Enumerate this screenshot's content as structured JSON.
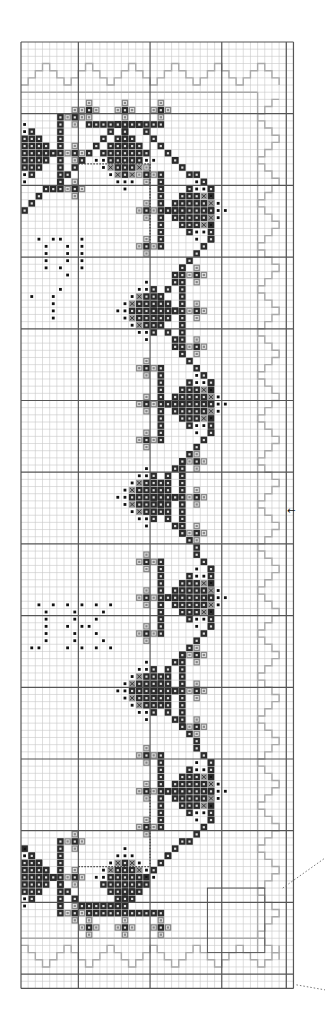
{
  "chart": {
    "type": "cross-stitch-pattern",
    "origin": [
      21,
      42
    ],
    "cell": 7.17,
    "cols": 38,
    "rows": 132,
    "major_every": 10,
    "major_offset_col": 8,
    "major_offset_row": 0
  },
  "colors": {
    "minor_line": "#c8c8c8",
    "major_line": "#555555",
    "dark_fill": "#2b2b2b",
    "mid_fill": "#8a8a8a",
    "dot": "#111111",
    "border_outline": "#a9a9a9",
    "leader_line": "#777777"
  },
  "legend_symbols": {
    "dark": "filled-triangle-stitch",
    "mid": "hollow-square-stitch",
    "x": "cross-stitch",
    "dot": "backstitch-dot"
  },
  "letters": [
    {
      "label": "R",
      "col": 1,
      "row": 27
    },
    {
      "label": "K",
      "col": 2,
      "row": 78
    }
  ],
  "center_arrow": {
    "symbol": "←",
    "x": 287,
    "y": 514
  },
  "motifs": [
    {
      "cx": 1,
      "cy": 15,
      "dir": "right",
      "partial": true
    },
    {
      "cx": 14,
      "cy": 15,
      "dir": "up"
    },
    {
      "cx": 23,
      "cy": 23,
      "dir": "left"
    },
    {
      "cx": 18,
      "cy": 37,
      "dir": "right"
    },
    {
      "cx": 23,
      "cy": 50,
      "dir": "left"
    },
    {
      "cx": 18,
      "cy": 63,
      "dir": "right"
    },
    {
      "cx": 23,
      "cy": 77,
      "dir": "left"
    },
    {
      "cx": 18,
      "cy": 90,
      "dir": "right"
    },
    {
      "cx": 23,
      "cy": 104,
      "dir": "left"
    },
    {
      "cx": 14,
      "cy": 117,
      "dir": "down"
    },
    {
      "cx": 1,
      "cy": 116,
      "dir": "right",
      "partial": true
    }
  ],
  "zigzag": [
    [
      0,
      23
    ],
    [
      8,
      16
    ],
    [
      13,
      11
    ],
    [
      16,
      11
    ],
    [
      21,
      16
    ],
    [
      26,
      20
    ],
    [
      26,
      27
    ],
    [
      22,
      31
    ],
    [
      18,
      37
    ],
    [
      22,
      43
    ],
    [
      26,
      47
    ],
    [
      26,
      54
    ],
    [
      22,
      58
    ],
    [
      18,
      63
    ],
    [
      22,
      68
    ],
    [
      26,
      73
    ],
    [
      26,
      81
    ],
    [
      22,
      85
    ],
    [
      18,
      90
    ],
    [
      22,
      95
    ],
    [
      26,
      100
    ],
    [
      26,
      108
    ],
    [
      20,
      113
    ],
    [
      13,
      120
    ],
    [
      8,
      120
    ],
    [
      0,
      112
    ]
  ]
}
